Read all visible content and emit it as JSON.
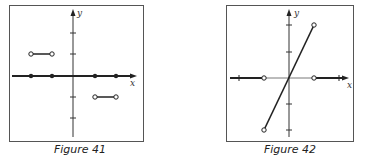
{
  "figures": [
    {
      "caption": "Figure 41",
      "x_label": "x",
      "y_label": "y",
      "description": "Step function: value 1 on (-3,-2), value -1 on (1,2) with open endpoints; zero elsewhere with filled points at x=-3,-2,1,2"
    },
    {
      "caption": "Figure 42",
      "x_label": "x",
      "y_label": "y",
      "description": "Line y=2x on (-1,1) with open endpoints at (-1,-2) and (1,2); y=0 for |x|>1 with open circles at x=-1 and x=1"
    }
  ]
}
